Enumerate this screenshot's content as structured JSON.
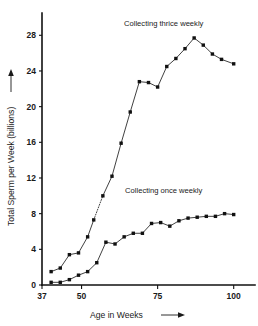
{
  "chart_data": {
    "type": "line",
    "title": "",
    "subtitle": "",
    "xlabel": "Age in Weeks",
    "ylabel": "Total Sperm per Week (billions)",
    "xlim": [
      37,
      107
    ],
    "ylim": [
      0,
      30.5
    ],
    "xticks": [
      37,
      50,
      75,
      100
    ],
    "xtick_labels": [
      "37",
      "50",
      "75",
      "100"
    ],
    "yticks": [
      0,
      4,
      8,
      12,
      16,
      20,
      24,
      28
    ],
    "ytick_labels": [
      "0",
      "4",
      "8",
      "12",
      "16",
      "20",
      "24",
      "28"
    ],
    "grid": false,
    "legend_position": "inline-annotation",
    "series": [
      {
        "name": "Collecting thrice weekly",
        "annotation": "Collecting thrice weekly",
        "marker": "filled-square",
        "x": [
          40,
          43,
          46,
          49,
          52,
          54,
          57,
          60,
          63,
          66,
          69,
          72,
          75,
          78,
          81,
          84,
          87,
          90,
          93,
          96,
          100
        ],
        "y": [
          1.5,
          1.9,
          3.4,
          3.6,
          5.4,
          7.3,
          10.0,
          12.2,
          15.9,
          19.4,
          22.8,
          22.7,
          22.2,
          24.5,
          25.4,
          26.5,
          27.7,
          26.9,
          25.9,
          25.3,
          24.8
        ],
        "interpolated_segment": {
          "from_x": 54,
          "to_x": 57,
          "style": "dotted"
        }
      },
      {
        "name": "Collecting once weekly",
        "annotation": "Collecting once weekly",
        "marker": "filled-square",
        "x": [
          40,
          43,
          46,
          49,
          52,
          55,
          58,
          61,
          64,
          67,
          70,
          73,
          76,
          79,
          82,
          85,
          88,
          91,
          94,
          97,
          100
        ],
        "y": [
          0.3,
          0.3,
          0.6,
          1.1,
          1.5,
          2.5,
          4.8,
          4.6,
          5.4,
          5.8,
          5.8,
          6.9,
          7.0,
          6.6,
          7.2,
          7.5,
          7.6,
          7.7,
          7.7,
          8.0,
          7.9
        ]
      }
    ],
    "annotations": [
      {
        "text": "Collecting thrice weekly",
        "x": 77,
        "y": 29.0
      },
      {
        "text": "Collecting once weekly",
        "x": 77,
        "y": 10.3
      }
    ]
  }
}
